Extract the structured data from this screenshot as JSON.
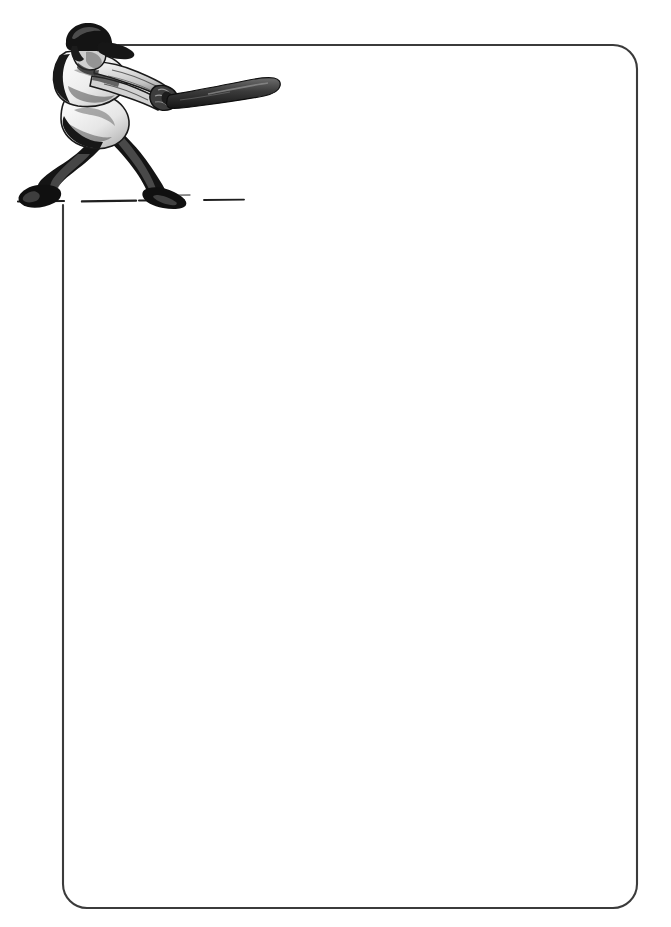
{
  "document": {
    "kind": "stationery-template",
    "title": "Baseball Batter Stationery",
    "orientation": "portrait",
    "page_width": 671,
    "page_height": 927,
    "background_color": "#ffffff",
    "body_text": "",
    "writing_area_placeholder": ""
  },
  "frame": {
    "name": "rounded-rectangle-border",
    "stroke_color": "#3b3b3b",
    "stroke_width": 2,
    "corner_radius": 24,
    "left": 63,
    "top": 45,
    "right": 637,
    "bottom": 908,
    "top_line_start_x": 118,
    "left_line_start_y": 205,
    "note": "Top edge is interrupted at the left where the batter illustration overlaps; left edge begins below the ground line."
  },
  "illustration": {
    "name": "baseball-batter",
    "description": "Grayscale comic-style illustration of a right-handed baseball batter in mid-swing, follow-through pose, with bat extended to the right and a ground shadow line beneath the feet.",
    "style": "halftone line art",
    "colors": {
      "ink": "#1a1a1a",
      "mid_gray": "#8a8a8a",
      "light_gray": "#c9c9c9",
      "highlight": "#f2f2f2"
    },
    "parts": [
      "batting-helmet",
      "head",
      "jersey",
      "arms",
      "hands",
      "baseball-bat",
      "pants",
      "front-leg",
      "rear-leg",
      "cleats",
      "ground-line"
    ],
    "bat": {
      "name": "baseball-bat",
      "angle_degrees": -7,
      "tip_x": 272,
      "knob_x": 160
    },
    "ground_line": {
      "name": "ground-shadow-line",
      "start_x": 18,
      "end_x": 242,
      "y": 201
    }
  }
}
